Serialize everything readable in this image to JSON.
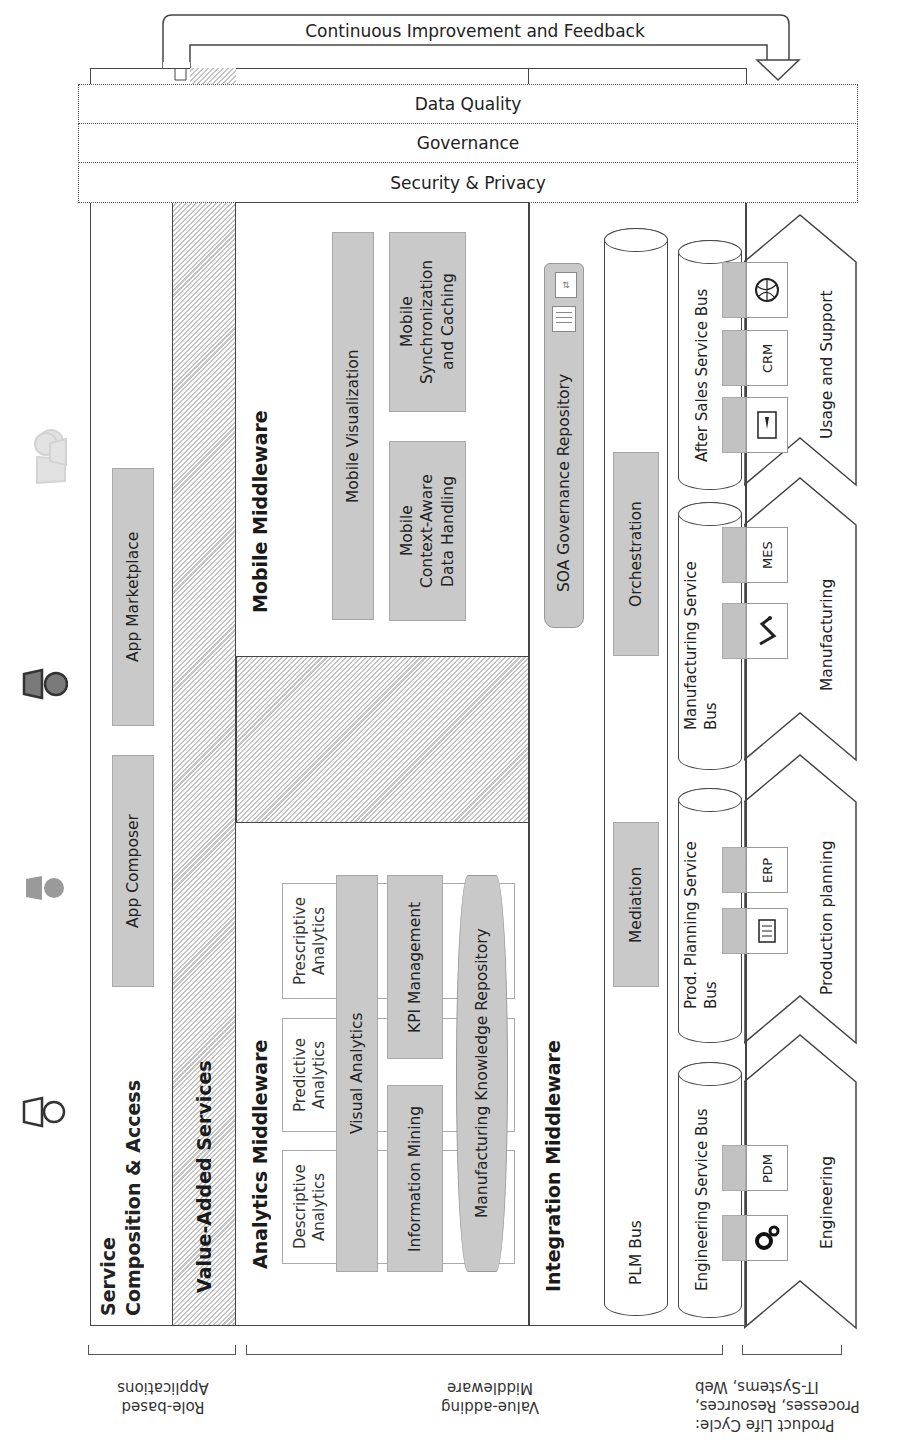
{
  "feedback_loop": {
    "label": "Continuous Improvement and Feedback"
  },
  "cross_cutting": {
    "bands": [
      {
        "label": "Data Quality"
      },
      {
        "label": "Governance"
      },
      {
        "label": "Security & Privacy"
      }
    ]
  },
  "roles": [
    {
      "name": "user-role-light",
      "shade": "#dddddd"
    },
    {
      "name": "user-role-dark",
      "shade": "#777777"
    },
    {
      "name": "user-role-medium",
      "shade": "#9a9a9a"
    },
    {
      "name": "user-role-outline",
      "shade": "#ffffff"
    }
  ],
  "service_composition": {
    "title_line1": "Service",
    "title_line2": "Composition & Access",
    "items": [
      {
        "label": "App Composer"
      },
      {
        "label": "App Marketplace"
      }
    ]
  },
  "value_added_services": {
    "title": "Value-Added Services"
  },
  "mobile_middleware": {
    "title": "Mobile Middleware",
    "items": [
      {
        "label": "Mobile Visualization"
      },
      {
        "label": "Mobile Context-Aware Data Handling",
        "lines": [
          "Mobile",
          "Context-Aware",
          "Data Handling"
        ]
      },
      {
        "label": "Mobile Synchronization and Caching",
        "lines": [
          "Mobile",
          "Synchronization",
          "and Caching"
        ]
      }
    ]
  },
  "analytics_middleware": {
    "title": "Analytics Middleware",
    "analytics_types": [
      {
        "line1": "Descriptive",
        "line2": "Analytics"
      },
      {
        "line1": "Predictive",
        "line2": "Analytics"
      },
      {
        "line1": "Prescriptive",
        "line2": "Analytics"
      }
    ],
    "visual_analytics": "Visual Analytics",
    "information_mining": "Information Mining",
    "kpi_management": "KPI Management",
    "knowledge_repository": "Manufacturing Knowledge Repository"
  },
  "integration_middleware": {
    "title": "Integration Middleware",
    "soa_repository": "SOA Governance Repository",
    "plm_bus": {
      "label": "PLM Bus",
      "components": [
        {
          "label": "Mediation"
        },
        {
          "label": "Orchestration"
        }
      ]
    },
    "service_buses": [
      {
        "label": "Engineering Service Bus",
        "systems": [
          {
            "icon": "gears-icon"
          },
          {
            "label": "PDM"
          }
        ]
      },
      {
        "label_line1": "Prod. Planning Service",
        "label_line2": "Bus",
        "systems": [
          {
            "icon": "checklist-icon"
          },
          {
            "label": "ERP"
          }
        ]
      },
      {
        "label_line1": "Manufacturing Service",
        "label_line2": "Bus",
        "systems": [
          {
            "icon": "robot-arm-icon"
          },
          {
            "label": "MES"
          }
        ]
      },
      {
        "label": "After Sales Service Bus",
        "systems": [
          {
            "icon": "manual-icon"
          },
          {
            "label": "CRM"
          },
          {
            "icon": "globe-icon"
          }
        ]
      }
    ]
  },
  "lifecycle_phases": [
    {
      "label": "Engineering"
    },
    {
      "label": "Production planning"
    },
    {
      "label": "Manufacturing"
    },
    {
      "label": "Usage and Support"
    }
  ],
  "bottom_labels": [
    {
      "line1": "Role-based",
      "line2": "Applications"
    },
    {
      "line1": "Value-adding",
      "line2": "Middleware"
    },
    {
      "line1": "Product Life Cycle:",
      "line2": "Processes, Resources,",
      "line3": "IT-Systems, Web"
    }
  ]
}
